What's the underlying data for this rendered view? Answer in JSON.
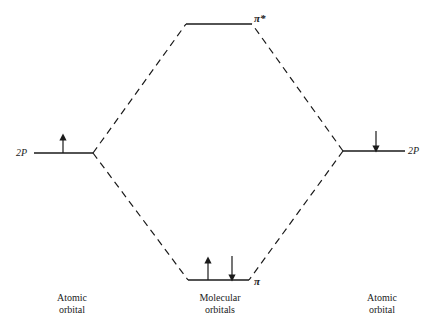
{
  "diagram": {
    "type": "molecular-orbital-energy-diagram",
    "left_atom": {
      "level_label": "2P",
      "electrons": [
        "up"
      ],
      "caption_line1": "Atomic",
      "caption_line2": "orbital"
    },
    "right_atom": {
      "level_label": "2P",
      "electrons": [
        "down"
      ],
      "caption_line1": "Atomic",
      "caption_line2": "orbital"
    },
    "antibonding": {
      "label": "π*",
      "electrons": []
    },
    "bonding": {
      "label": "π",
      "electrons": [
        "up",
        "down"
      ]
    },
    "center_caption": {
      "line1": "Molecular",
      "line2": "orbitals"
    },
    "colors": {
      "line": "#1a1a1a",
      "background": "#ffffff"
    }
  }
}
